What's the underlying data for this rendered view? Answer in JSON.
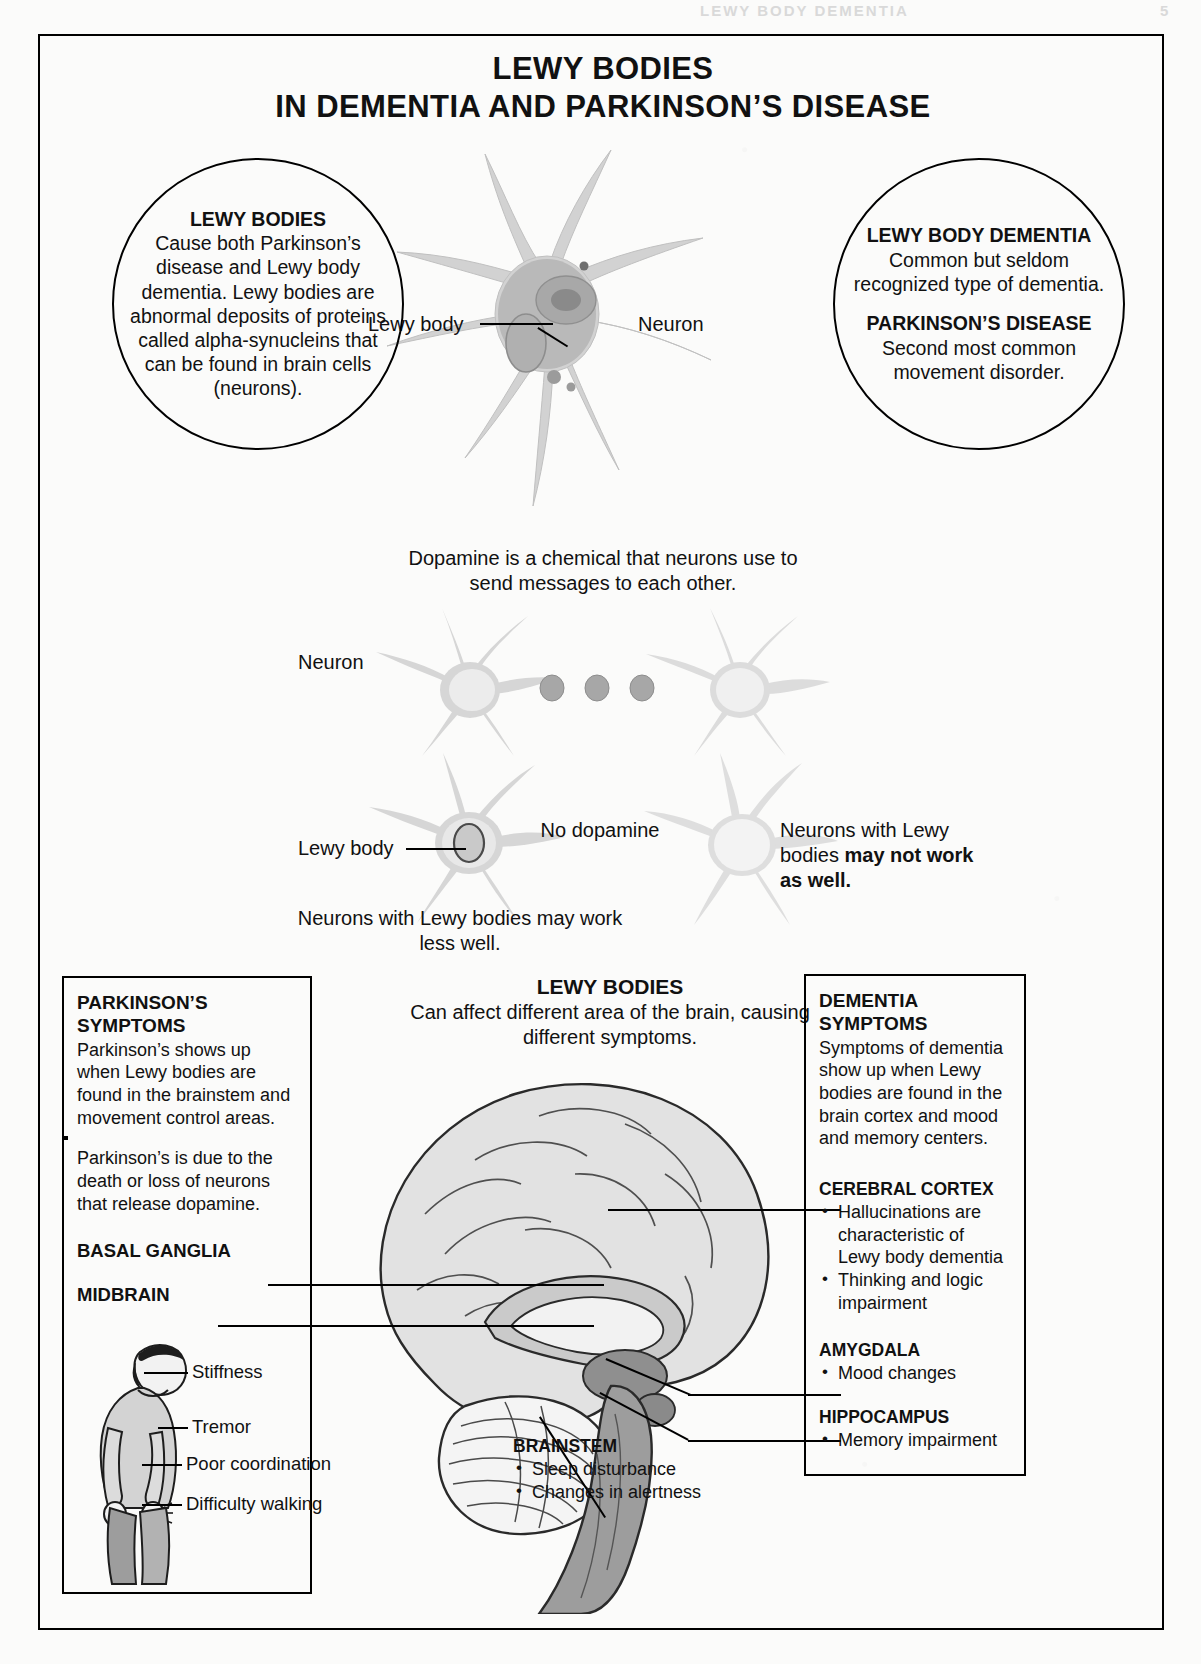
{
  "running_head": {
    "title": "LEWY BODY DEMENTIA",
    "page": "5"
  },
  "poster": {
    "title_line1": "LEWY BODIES",
    "title_line2": "IN DEMENTIA AND PARKINSON’S DISEASE"
  },
  "circle_left": {
    "heading": "LEWY BODIES",
    "body": "Cause both Parkinson’s disease and Lewy body dementia. Lewy bodies are abnormal deposits of proteins called alpha-synucleins that can be found in brain cells (neurons)."
  },
  "circle_right": {
    "heading1": "LEWY BODY DEMENTIA",
    "body1": "Common but seldom recognized type of dementia.",
    "heading2": "PARKINSON’S DISEASE",
    "body2": "Second most common movement disorder."
  },
  "neuron_diagram": {
    "lewy_body_label": "Lewy body",
    "neuron_label": "Neuron"
  },
  "dopamine": {
    "caption": "Dopamine is a chemical that neurons use to send messages to each other.",
    "neuron_label": "Neuron",
    "lewy_body_label": "Lewy body",
    "no_dopamine_label": "No dopamine",
    "right_note_plain": "Neurons with Lewy bodies ",
    "right_note_bold": "may not work as well.",
    "bottom_caption": "Neurons with Lewy bodies may work less well."
  },
  "brain_section": {
    "heading": "LEWY BODIES",
    "caption": "Can affect different area of the brain, causing different symptoms."
  },
  "parkinsons_box": {
    "heading_line1": "PARKINSON’S",
    "heading_line2": "SYMPTOMS",
    "paragraph1": "Parkinson’s shows up when Lewy bodies are found in the brainstem and movement control areas.",
    "paragraph2": "Parkinson’s is due to the death or loss of neurons that release dopamine.",
    "region1": "BASAL GANGLIA",
    "region2": "MIDBRAIN",
    "figure_labels": [
      "Stiffness",
      "Tremor",
      "Poor coordination",
      "Difficulty walking"
    ]
  },
  "dementia_box": {
    "heading_line1": "DEMENTIA",
    "heading_line2": "SYMPTOMS",
    "paragraph": "Symptoms of dementia show up when Lewy bodies are found in the brain cortex and mood and memory centers.",
    "regions": [
      {
        "name": "CEREBRAL CORTEX",
        "items": [
          "Hallucinations are characteristic of Lewy body dementia",
          "Thinking and logic impairment"
        ]
      },
      {
        "name": "AMYGDALA",
        "items": [
          "Mood changes"
        ]
      },
      {
        "name": "HIPPOCAMPUS",
        "items": [
          "Memory impairment"
        ]
      }
    ]
  },
  "brainstem_callout": {
    "name": "BRAINSTEM",
    "items": [
      "Sleep disturbance",
      "Changes in alertness"
    ]
  },
  "colors": {
    "ink": "#111111",
    "rule": "#000000",
    "art_gray": "#cfcfcf",
    "art_gray_dark": "#9a9a9a",
    "paper": "#fbfbfa"
  }
}
